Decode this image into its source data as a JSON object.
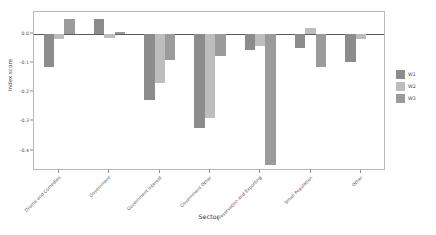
{
  "chart_data": {
    "type": "bar",
    "title": "",
    "xlabel": "Sector",
    "ylabel": "Index score",
    "ylim": [
      -0.47,
      0.075
    ],
    "yticks": [
      0.0,
      -0.1,
      -0.2,
      -0.3,
      -0.4
    ],
    "ytick_labels": [
      "0.0",
      "-0.1",
      "-0.2",
      "-0.3",
      "-0.4"
    ],
    "grid": false,
    "legend_position": "right",
    "categories": [
      "Drama and Comedies",
      "Government",
      "Government Interest",
      "Government Other",
      "Preservation and Exporting",
      "Small Population",
      "Other"
    ],
    "series": [
      {
        "name": "W1",
        "color": "#8c8c8c",
        "values": [
          -0.112,
          0.051,
          -0.225,
          -0.322,
          -0.055,
          -0.05,
          -0.095
        ]
      },
      {
        "name": "W2",
        "color": "#bdbdbd",
        "values": [
          -0.016,
          -0.015,
          -0.17,
          -0.29,
          -0.04,
          0.02,
          -0.016
        ]
      },
      {
        "name": "W3",
        "color": "#9b9b9b",
        "values": [
          0.051,
          0.007,
          -0.09,
          -0.075,
          -0.45,
          -0.115,
          0.0
        ]
      }
    ]
  },
  "legend": {
    "items": [
      {
        "label": "W1",
        "color": "#8c8c8c"
      },
      {
        "label": "W2",
        "color": "#bdbdbd"
      },
      {
        "label": "W3",
        "color": "#9b9b9b"
      }
    ]
  }
}
